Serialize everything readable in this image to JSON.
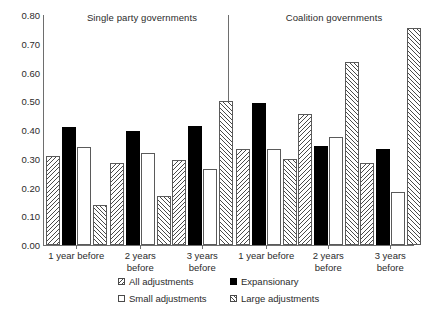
{
  "chart_data": {
    "type": "bar",
    "title": "",
    "xlabel": "",
    "ylabel": "",
    "ylim": [
      0.0,
      0.8
    ],
    "ytick_labels": [
      "0.80",
      "0.70",
      "0.60",
      "0.50",
      "0.40",
      "0.30",
      "0.20",
      "0.10",
      "0.00"
    ],
    "ytick_values": [
      0.8,
      0.7,
      0.6,
      0.5,
      0.4,
      0.3,
      0.2,
      0.1,
      0.0
    ],
    "grid": false,
    "legend_position": "bottom",
    "panels": [
      {
        "name": "single-party",
        "title": "Single party governments",
        "categories": [
          "1 year before",
          "2 years\nbefore",
          "3 years\nbefore"
        ]
      },
      {
        "name": "coalition",
        "title": "Coalition governments",
        "categories": [
          "1 year before",
          "2 years\nbefore",
          "3 years\nbefore"
        ]
      }
    ],
    "categories": [
      "1 year before",
      "2 years before",
      "3 years before",
      "1 year before",
      "2 years before",
      "3 years before"
    ],
    "series": [
      {
        "name": "All adjustments",
        "key": "all",
        "pattern": "backslash-hatch",
        "values": [
          0.31,
          0.285,
          0.295,
          0.335,
          0.455,
          0.285
        ]
      },
      {
        "name": "Expansionary",
        "key": "expansionary",
        "pattern": "solid-black",
        "values": [
          0.41,
          0.395,
          0.415,
          0.495,
          0.345,
          0.335
        ]
      },
      {
        "name": "Small adjustments",
        "key": "small",
        "pattern": "white",
        "values": [
          0.34,
          0.32,
          0.265,
          0.335,
          0.375,
          0.185
        ]
      },
      {
        "name": "Large adjustments",
        "key": "large",
        "pattern": "forwardslash-hatch",
        "values": [
          0.14,
          0.17,
          0.5,
          0.3,
          0.635,
          0.755
        ]
      }
    ]
  },
  "legend": {
    "items": [
      {
        "label": "All adjustments",
        "swatch": "backslash-hatch-swatch"
      },
      {
        "label": "Small adjustments",
        "swatch": "white-swatch"
      },
      {
        "label": "Expansionary",
        "swatch": "black-swatch"
      },
      {
        "label": "Large adjustments",
        "swatch": "forwardslash-hatch-swatch"
      }
    ]
  },
  "colors": {
    "bar_outline": "#5a5a5a",
    "expansionary_fill": "#000000",
    "hatch_stroke": "#4a4a4a",
    "axis": "#6e6e6e",
    "text": "#2b2b2b",
    "background": "#ffffff"
  }
}
